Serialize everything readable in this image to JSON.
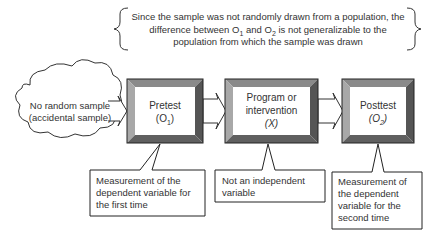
{
  "brace_note": {
    "line1": "Since the sample was not randomly drawn from a population, the",
    "line2_pre": "difference between O",
    "line2_sub1": "1",
    "line2_mid": " and O",
    "line2_sub2": "2",
    "line2_post": "  is not generalizable to the",
    "line3": "population from which the sample was drawn"
  },
  "cloud": {
    "line1": "No random sample",
    "line2": "(accidental sample)"
  },
  "boxes": [
    {
      "line1": "Pretest",
      "line2_pre": "(O",
      "line2_sub": "1",
      "line2_post": ")"
    },
    {
      "line1": "Program or",
      "line2": "intervention",
      "line3": "(X)"
    },
    {
      "line1": "Posttest",
      "line2_pre": "(O",
      "line2_sub": "2",
      "line2_post": ")"
    }
  ],
  "callouts": [
    {
      "line1": "Measurement of the",
      "line2": "dependent variable for",
      "line3": "the first time"
    },
    {
      "line1": "Not an independent",
      "line2": "variable"
    },
    {
      "line1": "Measurement of",
      "line2": "the dependent",
      "line3": "variable for the",
      "line4": "second time"
    }
  ],
  "colors": {
    "bevel_top": "#8a8a8a",
    "bevel_left": "#a8a8a8",
    "bevel_right": "#555555",
    "bevel_bottom": "#606060",
    "outline": "#222222"
  }
}
